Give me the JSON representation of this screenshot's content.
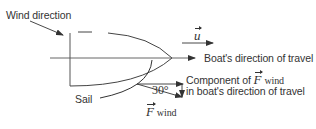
{
  "diagram": {
    "labels": {
      "wind_direction": "Wind direction",
      "boat_direction": "Boat's direction of travel",
      "component_line1_prefix": "Component of ",
      "component_line2": "in boat's direction of travel",
      "sail": "Sail",
      "angle": "30°",
      "velocity_symbol": "u",
      "force_symbol": "F",
      "force_subscript": "wind"
    },
    "colors": {
      "line": "#333333",
      "text": "#333333",
      "background": "#ffffff"
    }
  }
}
